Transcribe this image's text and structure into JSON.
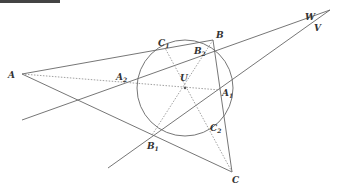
{
  "diagram": {
    "type": "geometry-incircle",
    "points": {
      "A": {
        "label": "A",
        "sub": "",
        "x": 22,
        "y": 74
      },
      "B": {
        "label": "B",
        "sub": "",
        "x": 213,
        "y": 40
      },
      "C": {
        "label": "C",
        "sub": "",
        "x": 232,
        "y": 172
      },
      "U": {
        "label": "U",
        "sub": "",
        "x": 185,
        "y": 88
      },
      "A1": {
        "label": "A",
        "sub": "1",
        "x": 220,
        "y": 90
      },
      "B1": {
        "label": "B",
        "sub": "1",
        "x": 152,
        "y": 135
      },
      "C1": {
        "label": "C",
        "sub": "1",
        "x": 165,
        "y": 48
      },
      "A2": {
        "label": "A",
        "sub": "2",
        "x": 128,
        "y": 83
      },
      "B2": {
        "label": "B",
        "sub": "2",
        "x": 198,
        "y": 52
      },
      "C2": {
        "label": "C",
        "sub": "2",
        "x": 210,
        "y": 125
      },
      "W": {
        "label": "W",
        "sub": "",
        "x": 312,
        "y": 20
      },
      "V": {
        "label": "V",
        "sub": "",
        "x": 312,
        "y": 24
      }
    },
    "circle": {
      "cx": 185,
      "cy": 88,
      "r": 48
    },
    "labels": {
      "A": "A",
      "B": "B",
      "C": "C",
      "U": "U",
      "W": "W",
      "V": "V",
      "A1": "A",
      "A1_sub": "1",
      "B1": "B",
      "B1_sub": "1",
      "C1": "C",
      "C1_sub": "1",
      "A2": "A",
      "A2_sub": "2",
      "B2": "B",
      "B2_sub": "2",
      "C2": "C",
      "C2_sub": "2"
    },
    "colors": {
      "line": "#666666",
      "dashed": "#888888",
      "text": "#333333",
      "background": "#ffffff"
    }
  }
}
